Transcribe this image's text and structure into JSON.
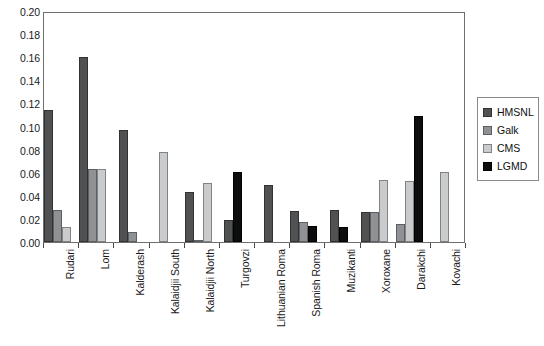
{
  "chart_data": {
    "type": "bar",
    "title": "",
    "subtitle": "",
    "xlabel": "",
    "ylabel": "",
    "ylim": [
      0,
      0.2
    ],
    "ytick_step": 0.02,
    "ytick_labels": [
      "0.20",
      "0.18",
      "0.16",
      "0.14",
      "0.12",
      "0.10",
      "0.08",
      "0.06",
      "0.04",
      "0.02",
      "0.00"
    ],
    "ytick_values": [
      0.2,
      0.18,
      0.16,
      0.14,
      0.12,
      0.1,
      0.08,
      0.06,
      0.04,
      0.02,
      0.0
    ],
    "grid": false,
    "legend_position": "right",
    "categories": [
      "Rudari",
      "Lom",
      "Kalderash",
      "Kalaidjii South",
      "Kalaidjii North",
      "Turgovzi",
      "Lithuanian Roma",
      "Spanish Roma",
      "Muzikanti",
      "Xoroxane",
      "Darakchi",
      "Kovachi"
    ],
    "series": [
      {
        "name": "HMSNL",
        "color": "#4f5153",
        "values": [
          0.114,
          0.16,
          0.097,
          0.0,
          0.043,
          0.019,
          0.049,
          0.027,
          0.028,
          0.026,
          0.0,
          0.0
        ]
      },
      {
        "name": "Galk",
        "color": "#8f9194",
        "values": [
          0.028,
          0.063,
          0.009,
          0.0,
          0.001,
          0.0,
          0.0,
          0.017,
          0.0,
          0.026,
          0.016,
          0.0
        ]
      },
      {
        "name": "CMS",
        "color": "#c9cbcc",
        "values": [
          0.013,
          0.063,
          0.0,
          0.078,
          0.051,
          0.0,
          0.0,
          0.0,
          0.0,
          0.054,
          0.053,
          0.061
        ]
      },
      {
        "name": "LGMD",
        "color": "#0d0d0d",
        "values": [
          0.0,
          0.0,
          0.0,
          0.0,
          0.0,
          0.061,
          0.0,
          0.014,
          0.013,
          0.0,
          0.109,
          0.0
        ]
      }
    ]
  },
  "legend": {
    "items": [
      {
        "label": "HMSNL",
        "key": "hmsnl"
      },
      {
        "label": "Galk",
        "key": "galk"
      },
      {
        "label": "CMS",
        "key": "cms"
      },
      {
        "label": "LGMD",
        "key": "lgmd"
      }
    ]
  },
  "axes": {
    "y_min_label": "0.00",
    "y_max_label": "0.20"
  }
}
